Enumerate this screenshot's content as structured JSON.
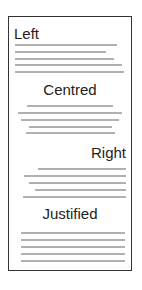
{
  "diagram": {
    "sections": [
      {
        "heading": "Left",
        "align": "left"
      },
      {
        "heading": "Centred",
        "align": "center"
      },
      {
        "heading": "Right",
        "align": "right"
      },
      {
        "heading": "Justified",
        "align": "justify"
      }
    ],
    "colors": {
      "border": "#333333",
      "text": "#222222",
      "line": "#b0b0b0"
    }
  }
}
